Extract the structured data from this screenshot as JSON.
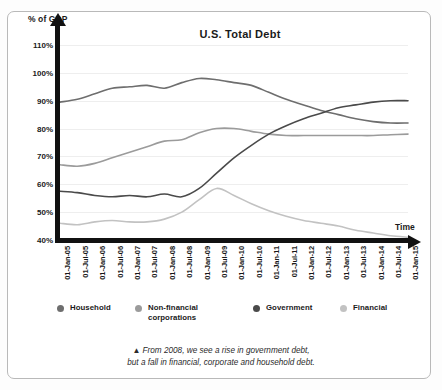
{
  "chart_data": {
    "type": "line",
    "title": "U.S. Total Debt",
    "ylabel": "% of GDP",
    "xlabel": "Time",
    "ylim": [
      40,
      110
    ],
    "yticks": [
      "110%",
      "100%",
      "90%",
      "80%",
      "70%",
      "60%",
      "50%",
      "40%"
    ],
    "ytick_values": [
      110,
      100,
      90,
      80,
      70,
      60,
      50,
      40
    ],
    "grid": true,
    "legend_position": "bottom",
    "categories": [
      "01-Jan-05",
      "01-Jul-05",
      "01-Jan-06",
      "01-Jul-06",
      "01-Jan-07",
      "01-Jul-07",
      "01-Jan-08",
      "01-Jul-08",
      "01-Jan-09",
      "01-Jul-09",
      "01-Jan-10",
      "01-Jul-10",
      "01-Jan-11",
      "01-Jul-11",
      "01-Jan-12",
      "01-Jul-12",
      "01-Jan-13",
      "01-Jul-13",
      "01-Jan-14",
      "01-Jul-14",
      "01-Jan-15"
    ],
    "series": [
      {
        "name": "Household",
        "color": "#6e6e6e",
        "values": [
          89.5,
          90.5,
          92.5,
          94.5,
          95.0,
          95.5,
          94.5,
          96.5,
          98.0,
          97.5,
          96.5,
          95.5,
          93.0,
          90.5,
          88.5,
          86.5,
          85.0,
          83.5,
          82.5,
          82.0,
          82.0
        ]
      },
      {
        "name": "Non-financial corporations",
        "color": "#9b9b9b",
        "values": [
          67.0,
          66.5,
          67.5,
          69.5,
          71.5,
          73.5,
          75.5,
          76.0,
          78.5,
          80.0,
          80.0,
          79.0,
          78.0,
          77.5,
          77.5,
          77.5,
          77.5,
          77.5,
          77.5,
          77.8,
          78.0
        ]
      },
      {
        "name": "Government",
        "color": "#4a4a4a",
        "values": [
          57.5,
          57.0,
          56.0,
          55.5,
          56.0,
          55.5,
          56.5,
          55.5,
          58.5,
          64.0,
          69.5,
          74.0,
          78.0,
          81.0,
          83.5,
          85.5,
          87.5,
          88.5,
          89.5,
          90.0,
          90.0
        ]
      },
      {
        "name": "Financial",
        "color": "#c2c2c2",
        "values": [
          46.0,
          45.5,
          46.5,
          47.0,
          46.5,
          46.5,
          47.5,
          50.0,
          54.5,
          58.5,
          56.0,
          53.0,
          50.5,
          48.5,
          47.0,
          46.0,
          45.0,
          43.5,
          42.5,
          41.5,
          41.0
        ]
      }
    ]
  },
  "chart": {
    "title": "U.S. Total Debt",
    "ylabel": "% of GDP",
    "xlabel": "Time"
  },
  "legend": {
    "items": [
      {
        "label": "Household",
        "color": "#6e6e6e"
      },
      {
        "label": "Non-financial corporations",
        "color": "#9b9b9b"
      },
      {
        "label": "Government",
        "color": "#4a4a4a"
      },
      {
        "label": "Financial",
        "color": "#c2c2c2"
      }
    ]
  },
  "caption": {
    "marker": "▲",
    "line1": "From 2008, we see a rise in government debt,",
    "line2": "but a fall in financial, corporate and household debt."
  }
}
